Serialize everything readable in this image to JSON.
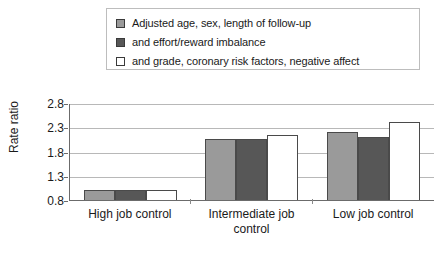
{
  "chart_data": {
    "type": "bar",
    "title": "",
    "xlabel": "",
    "ylabel": "Rate ratio",
    "categories": [
      "High job control",
      "Intermediate job control",
      "Low job control"
    ],
    "ylim": [
      0.8,
      2.8
    ],
    "yticks": [
      "0.8",
      "1.3",
      "1.8",
      "2.3",
      "2.8"
    ],
    "grid": true,
    "legend_position": "top",
    "series": [
      {
        "name": "Adjusted age, sex, length of follow-up",
        "color": "#9a9a9a",
        "values": [
          1.0,
          2.05,
          2.2
        ]
      },
      {
        "name": "and effort/reward imbalance",
        "color": "#575757",
        "values": [
          1.0,
          2.05,
          2.1
        ]
      },
      {
        "name": "and grade, coronary risk factors, negative affect",
        "color": "#ffffff",
        "values": [
          1.0,
          2.15,
          2.4
        ]
      }
    ]
  }
}
